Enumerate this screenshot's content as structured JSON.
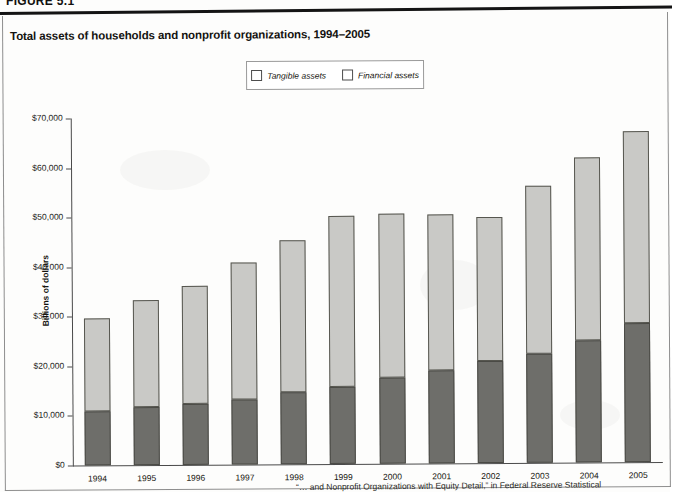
{
  "document": {
    "figure_label": "FIGURE 5.1",
    "source_note_visible": "“… and Nonprofit Organizations with Equity Detail,” in Federal Reserve Statistical"
  },
  "chart_title": "Total assets of households and nonprofit organizations, 1994–2005",
  "legend": {
    "items": [
      {
        "label": "Tangible assets",
        "color": "#6e6e6a"
      },
      {
        "label": "Financial assets",
        "color": "#c9c9c6"
      }
    ]
  },
  "colors": {
    "tangible": "#6e6e6a",
    "financial": "#c9c9c6",
    "axis": "#4a4a4a",
    "text": "#17160f"
  },
  "chart_data": {
    "type": "bar",
    "subtype": "stacked",
    "title": "Total assets of households and nonprofit organizations, 1994–2005",
    "xlabel": "",
    "ylabel": "Billions of dollars",
    "ylim": [
      0,
      70000
    ],
    "ytick_values": [
      0,
      10000,
      20000,
      30000,
      40000,
      50000,
      60000,
      70000
    ],
    "ytick_labels": [
      "$0",
      "$10,000",
      "$20,000",
      "$30,000",
      "$40,000",
      "$50,000",
      "$60,000",
      "$70,000"
    ],
    "grid": false,
    "legend_position": "top-center",
    "categories": [
      "1994",
      "1995",
      "1996",
      "1997",
      "1998",
      "1999",
      "2000",
      "2001",
      "2002",
      "2003",
      "2004",
      "2005"
    ],
    "series": [
      {
        "name": "Tangible assets",
        "color": "#6e6e6a",
        "values": [
          10900,
          11700,
          12300,
          13200,
          14500,
          15600,
          17400,
          18700,
          20500,
          22000,
          24700,
          28100
        ]
      },
      {
        "name": "Financial assets",
        "color": "#c9c9c6",
        "values": [
          18800,
          21500,
          23800,
          27500,
          30700,
          34400,
          33000,
          31500,
          29200,
          33900,
          36800,
          38700
        ]
      }
    ],
    "totals": [
      29700,
      33200,
      36100,
      40700,
      45200,
      50000,
      50400,
      50200,
      49700,
      55900,
      61500,
      66800
    ]
  }
}
